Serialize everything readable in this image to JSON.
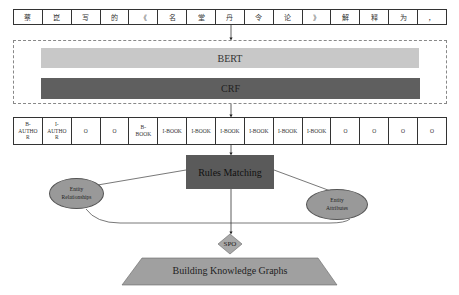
{
  "input_tokens": [
    "蔡",
    "崑",
    "写",
    "的",
    "《",
    "名",
    "堂",
    "丹",
    "令",
    "论",
    "》",
    "解",
    "释",
    "为",
    "，"
  ],
  "model": {
    "encoder_label": "BERT",
    "decoder_label": "CRF"
  },
  "tags": [
    "B-AUTHOR",
    "I-AUTHOR",
    "O",
    "O",
    "B-BOOK",
    "I-BOOK",
    "I-BOOK",
    "I-BOOK",
    "I-BOOK",
    "I-BOOK",
    "I-BOOK",
    "O",
    "O",
    "O",
    "O"
  ],
  "tags_display": [
    "B-\nAUTHO\nR",
    "I-\nAUTHO\nR",
    "O",
    "O",
    "B-\nBOOK",
    "I-BOOK",
    "I-BOOK",
    "I-BOOK",
    "I-BOOK",
    "I-BOOK",
    "I-BOOK",
    "O",
    "O",
    "O",
    "O"
  ],
  "rules_matching": {
    "label": "Rules Matching"
  },
  "entity_relationships": {
    "line1": "Entity",
    "line2": "Relationships"
  },
  "entity_attributes": {
    "line1": "Entity",
    "line2": "Attributes"
  },
  "spo": {
    "label": "SPO"
  },
  "knowledge_graph": {
    "label": "Building Knowledge Graphs"
  },
  "colors": {
    "bert": "#c8c8c8",
    "crf": "#5f5f5f",
    "rules": "#5a5a5a",
    "ellipse": "#999999",
    "spo": "#a8a8a8",
    "kg": "#a0a0a0"
  }
}
